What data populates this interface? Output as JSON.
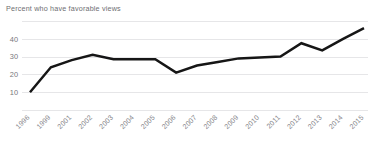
{
  "chart_data": {
    "type": "line",
    "title": "Percent who have favorable views",
    "xlabel": "",
    "ylabel": "",
    "categories": [
      "1996",
      "1999",
      "2001",
      "2002",
      "2003",
      "2004",
      "2005",
      "2006",
      "2007",
      "2008",
      "2009",
      "2010",
      "2011",
      "2012",
      "2013",
      "2014",
      "2015"
    ],
    "values": [
      10,
      24,
      28,
      31,
      28.5,
      28.5,
      28.5,
      21,
      25,
      27,
      29,
      29.5,
      30,
      37.5,
      33.5,
      40,
      46
    ],
    "series": [
      {
        "name": "Percent who have favorable views",
        "values": [
          10,
          24,
          28,
          31,
          28.5,
          28.5,
          28.5,
          21,
          25,
          27,
          29,
          29.5,
          30,
          37.5,
          33.5,
          40,
          46
        ]
      }
    ],
    "ylim": [
      0,
      50
    ],
    "y_ticks": [
      0,
      10,
      20,
      30,
      40,
      50
    ],
    "y_tick_labels": [
      "",
      "10",
      "20",
      "30",
      "40",
      ""
    ],
    "grid": true,
    "legend": false,
    "line_color": "#161616",
    "grid_color": "#dcdcde",
    "tick_label_color": "#87878c",
    "title_color": "#6e6e72",
    "background": "#ffffff",
    "x_label_rotation": -45
  }
}
